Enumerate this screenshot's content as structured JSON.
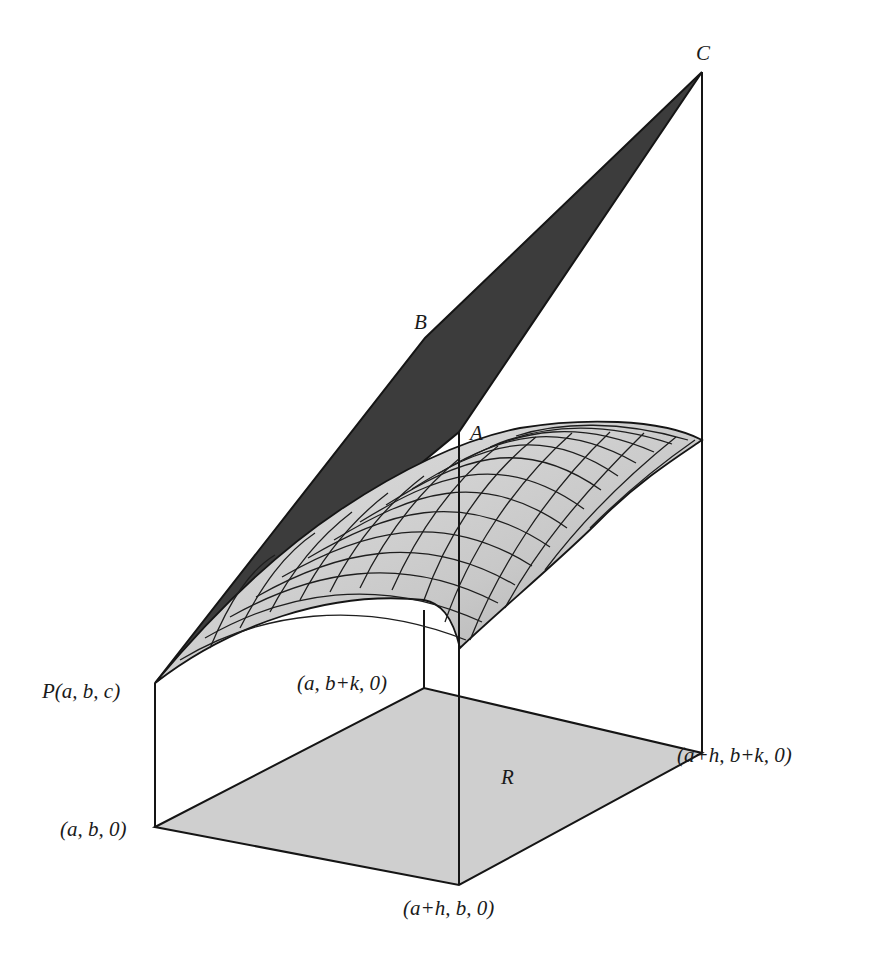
{
  "figure": {
    "colors": {
      "background": "#ffffff",
      "plane_fill": "#3c3c3c",
      "surface_fill": "#c8c8c8",
      "region_fill": "#cfcfcf",
      "edge": "#151515"
    },
    "labels": {
      "C": "C",
      "B": "B",
      "A": "A",
      "P": "P(a, b, c)",
      "ab0": "(a, b, 0)",
      "abk0": "(a, b+k, 0)",
      "ahbk0": "(a+h, b+k, 0)",
      "ahb0": "(a+h, b, 0)",
      "R": "R"
    }
  }
}
